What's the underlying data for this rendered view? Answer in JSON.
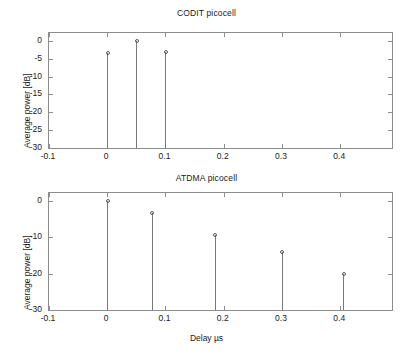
{
  "figure": {
    "width": 413,
    "height": 354,
    "background": "#ffffff",
    "line_color": "#7a7a7a",
    "axis_color": "#8d8d8d",
    "text_color": "#1a1a1a"
  },
  "chart_data": [
    {
      "type": "scatter",
      "plot_style": "stem",
      "title": "CODIT picocell",
      "xlabel": "",
      "ylabel": "Average power [dB]",
      "xlim": [
        -0.1,
        0.4889
      ],
      "ylim": [
        -30,
        2.2
      ],
      "xticks": [
        -0.1,
        0,
        0.1,
        0.2,
        0.3,
        0.4
      ],
      "xticklabels": [
        "-0.1",
        "0",
        "0.1",
        "0.2",
        "0.3",
        "0.4"
      ],
      "yticks": [
        0,
        -5,
        -10,
        -15,
        -20,
        -25,
        -30
      ],
      "yticklabels": [
        "0",
        "-5",
        "-10",
        "-15",
        "-20",
        "-25",
        "-30"
      ],
      "grid": false,
      "legend": null,
      "baseline": -30,
      "x": [
        0.0,
        0.05,
        0.1
      ],
      "values": [
        -3.5,
        0.0,
        -3.0
      ],
      "points": [
        {
          "x": 0.0,
          "y": -3.5
        },
        {
          "x": 0.05,
          "y": 0.0
        },
        {
          "x": 0.1,
          "y": -3.0
        }
      ]
    },
    {
      "type": "scatter",
      "plot_style": "stem",
      "title": "ATDMA picocell",
      "xlabel": "Delay µs",
      "ylabel": "Average power [dB]",
      "xlim": [
        -0.1,
        0.4889
      ],
      "ylim": [
        -30,
        2.2
      ],
      "xticks": [
        -0.1,
        0,
        0.1,
        0.2,
        0.3,
        0.4
      ],
      "xticklabels": [
        "-0.1",
        "0",
        "0.1",
        "0.2",
        "0.3",
        "0.4"
      ],
      "yticks": [
        0,
        -10,
        -20,
        -30
      ],
      "yticklabels": [
        "0",
        "-10",
        "-20",
        "-30"
      ],
      "grid": false,
      "legend": null,
      "baseline": -30,
      "x": [
        0.0,
        0.076,
        0.185,
        0.3,
        0.405
      ],
      "values": [
        0.0,
        -3.3,
        -9.3,
        -14.0,
        -20.0
      ],
      "points": [
        {
          "x": 0.0,
          "y": 0.0
        },
        {
          "x": 0.076,
          "y": -3.3
        },
        {
          "x": 0.185,
          "y": -9.3
        },
        {
          "x": 0.3,
          "y": -14.0
        },
        {
          "x": 0.405,
          "y": -20.0
        }
      ]
    }
  ]
}
